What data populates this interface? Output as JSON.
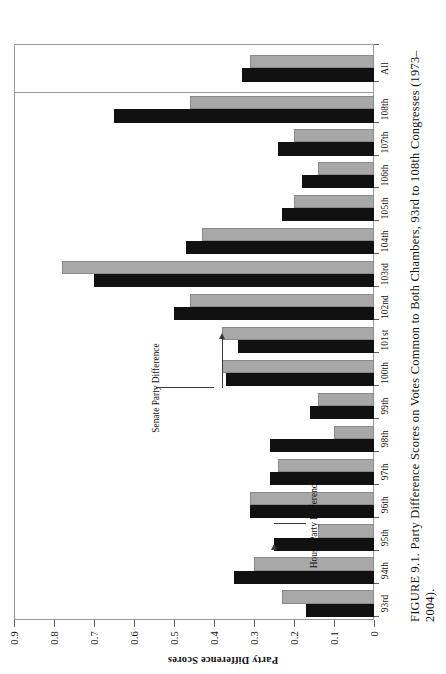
{
  "caption": {
    "figure_number": "FIGURE 9.1.",
    "text": "Party Difference Scores on Votes Common to Both Chambers, 93rd to 108th Congresses (1973–2004)."
  },
  "axes": {
    "y_title": "Party Difference Scores",
    "y_ticks": [
      "0",
      "0.1",
      "0.2",
      "0.3",
      "0.4",
      "0.5",
      "0.6",
      "0.7",
      "0.8",
      "0.9"
    ],
    "y_min": 0,
    "y_max": 0.9,
    "x_title": ""
  },
  "annotations": [
    {
      "label": "House Party Difference",
      "target": "95th-house-bar"
    },
    {
      "label": "Senate Party Difference",
      "target": "101st-senate-bar"
    }
  ],
  "colors": {
    "house_bar": "#111111",
    "senate_bar": "#a8a8a8",
    "frame": "#9a9a9a",
    "text": "#111111"
  },
  "chart_data": {
    "type": "bar",
    "title": "Party Difference Scores on Votes Common to Both Chambers, 93rd to 108th Congresses (1973–2004)",
    "xlabel": "",
    "ylabel": "Party Difference Scores",
    "ylim": [
      0,
      0.9
    ],
    "grid": false,
    "legend": "annotated (House Party Difference / Senate Party Difference)",
    "orientation": "vertical",
    "categories": [
      "93rd",
      "94th",
      "95th",
      "96th",
      "97th",
      "98th",
      "99th",
      "100th",
      "101st",
      "102nd",
      "103rd",
      "104th",
      "105th",
      "106th",
      "107th",
      "108th",
      "All"
    ],
    "series": [
      {
        "name": "House Party Difference",
        "color": "#111111",
        "values": [
          0.17,
          0.35,
          0.25,
          0.31,
          0.26,
          0.26,
          0.16,
          0.37,
          0.34,
          0.5,
          0.7,
          0.47,
          0.23,
          0.18,
          0.24,
          0.65,
          0.33
        ]
      },
      {
        "name": "Senate Party Difference",
        "color": "#a8a8a8",
        "values": [
          0.23,
          0.3,
          0.14,
          0.31,
          0.24,
          0.1,
          0.14,
          0.38,
          0.38,
          0.46,
          0.78,
          0.43,
          0.2,
          0.14,
          0.2,
          0.46,
          0.31
        ]
      }
    ]
  }
}
